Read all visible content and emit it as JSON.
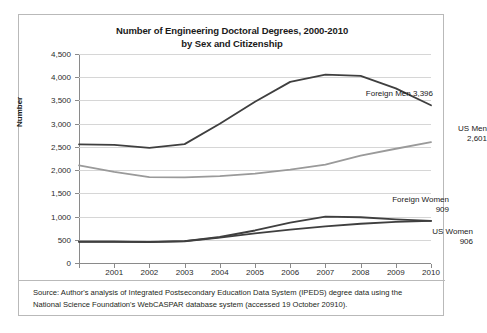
{
  "figure": {
    "title_line1": "Number of Engineering Doctoral Degrees, 2000-2010",
    "title_line2": "by Sex and Citizenship",
    "source_line1": "Source: Author's analysis of Integrated Postsecondary Education Data System (IPEDS) degree data using the",
    "source_line2": "National Science Foundation's WebCASPAR database system (accessed 19 October 20910)."
  },
  "chart_data": {
    "type": "line",
    "title": "Number of Engineering Doctoral Degrees, 2000-2010 by Sex and Citizenship",
    "xlabel": "",
    "ylabel": "Number",
    "x": [
      2000,
      2001,
      2002,
      2003,
      2004,
      2005,
      2006,
      2007,
      2008,
      2009,
      2010
    ],
    "xtick_labels": [
      "2001",
      "2002",
      "2003",
      "2004",
      "2005",
      "2006",
      "2007",
      "2008",
      "2009",
      "2010"
    ],
    "ytick_labels": [
      "0",
      "500",
      "1,000",
      "1,500",
      "2,000",
      "2,500",
      "3,000",
      "3,500",
      "4,000",
      "4,500"
    ],
    "ylim": [
      0,
      4500
    ],
    "ytick_step": 500,
    "grid": true,
    "legend_position": "inline-right-labels",
    "series": [
      {
        "name": "Foreign Men",
        "color": "#3f3f3f",
        "end_label_line1": "Foreign Men 3,396",
        "end_label_line2": "",
        "end_value": 3396,
        "values": [
          2555,
          2545,
          2480,
          2560,
          3000,
          3470,
          3900,
          4055,
          4030,
          3760,
          3396
        ]
      },
      {
        "name": "US Men",
        "color": "#9a9a9a",
        "end_label_line1": "US Men",
        "end_label_line2": "2,601",
        "end_value": 2601,
        "values": [
          2100,
          1960,
          1850,
          1845,
          1870,
          1925,
          2010,
          2120,
          2310,
          2460,
          2601
        ]
      },
      {
        "name": "Foreign Women",
        "color": "#3f3f3f",
        "end_label_line1": "Foreign Women",
        "end_label_line2": "909",
        "end_value": 909,
        "values": [
          460,
          462,
          455,
          470,
          560,
          700,
          870,
          1000,
          985,
          940,
          909
        ]
      },
      {
        "name": "US Women",
        "color": "#3f3f3f",
        "end_label_line1": "US Women",
        "end_label_line2": "906",
        "end_value": 906,
        "values": [
          458,
          458,
          450,
          468,
          545,
          640,
          720,
          790,
          845,
          885,
          906
        ]
      }
    ]
  }
}
